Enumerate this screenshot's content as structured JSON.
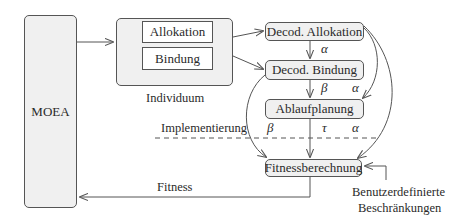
{
  "diagram": {
    "moea": {
      "label": "MOEA"
    },
    "individuum": {
      "label": "Individuum",
      "parts": [
        {
          "label": "Allokation"
        },
        {
          "label": "Bindung"
        }
      ]
    },
    "nodes": {
      "decod_allokation": "Decod. Allokation",
      "decod_bindung": "Decod. Bindung",
      "ablaufplanung": "Ablaufplanung",
      "fitnessberechnung": "Fitnessberechnung"
    },
    "edge_labels": {
      "alloc_to_bind": "α",
      "bind_to_ablauf": "β",
      "alloc_to_ablauf": "α",
      "bind_to_fitness": "β",
      "ablauf_to_fitness": "τ",
      "alloc_to_fitness": "α"
    },
    "implementation_line_label": "Implementierung",
    "fitness_feedback_label": "Fitness",
    "constraints_label": [
      "Benutzerdefinierte",
      "Beschränkungen"
    ]
  }
}
